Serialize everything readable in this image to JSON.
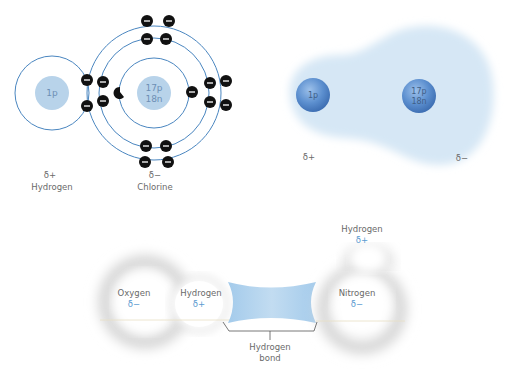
{
  "panel_bohr": {
    "hydrogen": {
      "nucleus": "1p",
      "charge": "δ+",
      "name": "Hydrogen"
    },
    "chlorine": {
      "nucleus_p": "17p",
      "nucleus_n": "18n",
      "charge": "δ−",
      "name": "Chlorine"
    }
  },
  "panel_cloud": {
    "hydrogen": {
      "nucleus": "1p",
      "charge": "δ+"
    },
    "chlorine": {
      "nucleus_p": "17p",
      "nucleus_n": "18n",
      "charge": "δ−"
    }
  },
  "panel_hbond": {
    "oxygen": {
      "name": "Oxygen",
      "charge": "δ−"
    },
    "hydrogen_left": {
      "name": "Hydrogen",
      "charge": "δ+"
    },
    "nitrogen": {
      "name": "Nitrogen",
      "charge": "δ−"
    },
    "hydrogen_top": {
      "name": "Hydrogen",
      "charge": "δ+"
    },
    "bond_label_1": "Hydrogen",
    "bond_label_2": "bond"
  },
  "colors": {
    "orbit": "#4a86c0",
    "nucleus_flat": "#b8d3ea",
    "cloud": "#dbeaf6",
    "nucleus_sphere": "#5c8fcf",
    "electron": "#111111",
    "bond": "#a9cde9"
  }
}
